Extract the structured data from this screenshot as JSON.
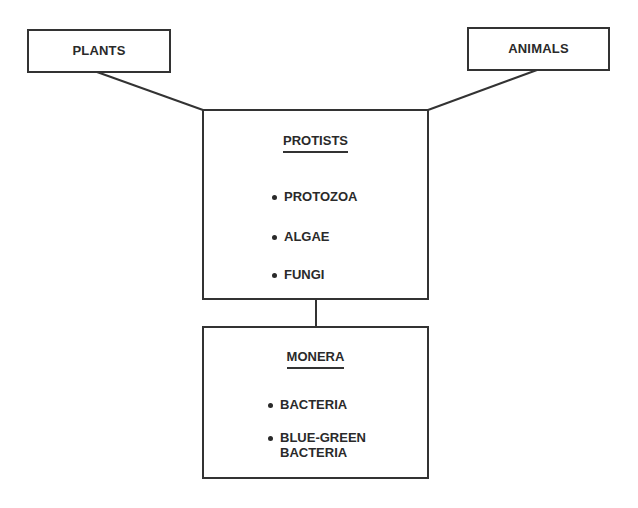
{
  "diagram": {
    "type": "classification-hierarchy",
    "nodes": {
      "plants": {
        "label": "PLANTS"
      },
      "animals": {
        "label": "ANIMALS"
      },
      "protists": {
        "title": "PROTISTS",
        "items": [
          "PROTOZOA",
          "ALGAE",
          "FUNGI"
        ]
      },
      "monera": {
        "title": "MONERA",
        "items": [
          "BACTERIA",
          "BLUE-GREEN",
          "BACTERIA"
        ]
      }
    },
    "edges": [
      {
        "from": "plants",
        "to": "protists"
      },
      {
        "from": "animals",
        "to": "protists"
      },
      {
        "from": "protists",
        "to": "monera"
      }
    ],
    "colors": {
      "stroke": "#333333",
      "text": "#2a2a2a",
      "background": "#ffffff"
    }
  }
}
